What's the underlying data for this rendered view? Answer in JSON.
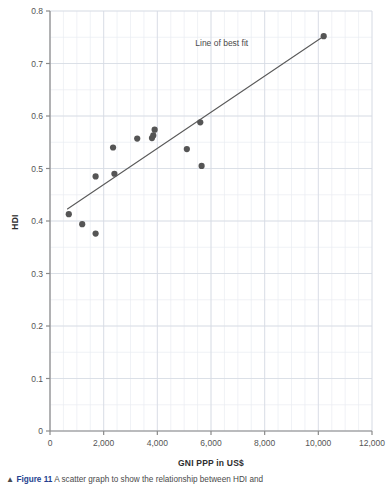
{
  "chart_data": {
    "type": "scatter",
    "title": "",
    "xlabel": "GNI PPP in US$",
    "ylabel": "HDI",
    "xlim": [
      0,
      12000
    ],
    "ylim": [
      0,
      0.8
    ],
    "grid": true,
    "minor_grid": true,
    "legend": "none",
    "x_ticks": [
      0,
      2000,
      4000,
      6000,
      8000,
      10000,
      12000
    ],
    "x_tick_labels": [
      "0",
      "2,000",
      "4,000",
      "6,000",
      "8,000",
      "10,000",
      "12,000"
    ],
    "y_ticks": [
      0,
      0.1,
      0.2,
      0.3,
      0.4,
      0.5,
      0.6,
      0.7,
      0.8
    ],
    "y_tick_labels": [
      "0",
      "0.1",
      "0.2",
      "0.3",
      "0.4",
      "0.5",
      "0.6",
      "0.7",
      "0.8"
    ],
    "series": [
      {
        "name": "Countries",
        "marker": "circle",
        "color": "#555555",
        "points": [
          {
            "x": 700,
            "y": 0.413
          },
          {
            "x": 1200,
            "y": 0.394
          },
          {
            "x": 1700,
            "y": 0.376
          },
          {
            "x": 1700,
            "y": 0.485
          },
          {
            "x": 2350,
            "y": 0.54
          },
          {
            "x": 2400,
            "y": 0.49
          },
          {
            "x": 3250,
            "y": 0.557
          },
          {
            "x": 3800,
            "y": 0.558
          },
          {
            "x": 3850,
            "y": 0.563
          },
          {
            "x": 3900,
            "y": 0.574
          },
          {
            "x": 5100,
            "y": 0.537
          },
          {
            "x": 5600,
            "y": 0.588
          },
          {
            "x": 5650,
            "y": 0.505
          },
          {
            "x": 10200,
            "y": 0.752
          }
        ]
      }
    ],
    "trendline": {
      "label": "Line of best fit",
      "color": "#5a5a5a",
      "x1": 650,
      "y1": 0.423,
      "x2": 10200,
      "y2": 0.752
    },
    "annotations": [
      {
        "text": "Line of best fit",
        "x": 6400,
        "y": 0.733,
        "anchor": "middle"
      }
    ],
    "colors": {
      "marker": "#555555",
      "line": "#5a5a5a",
      "axis": "#8a8a8a",
      "grid_major": "#d6dbe3",
      "grid_minor": "#e9edf2",
      "text": "#3b3b3b",
      "background": "#ffffff"
    }
  },
  "caption": {
    "prefix": "▲",
    "figure_label": "Figure 11",
    "text": "A scatter graph to show the relationship between HDI and"
  }
}
